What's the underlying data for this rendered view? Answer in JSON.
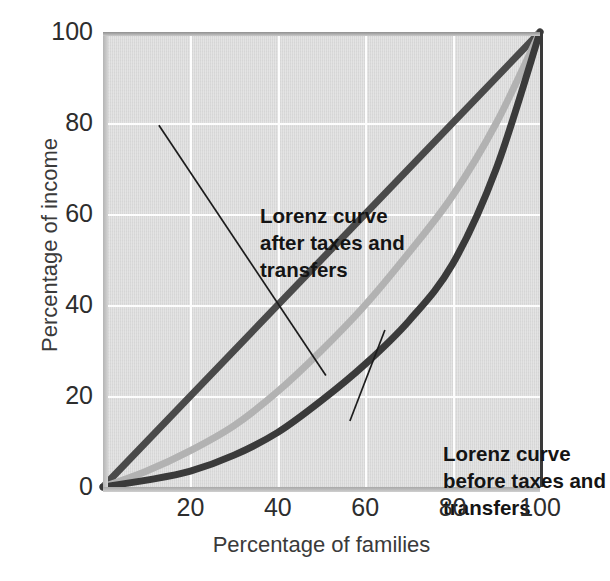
{
  "chart_data": {
    "type": "line",
    "title": "",
    "subtitle": "",
    "xlabel": "Percentage of families",
    "ylabel": "Percentage of income",
    "xlim": [
      0,
      100
    ],
    "ylim": [
      0,
      100
    ],
    "xticks": [
      20,
      40,
      60,
      80,
      100
    ],
    "yticks": [
      0,
      20,
      40,
      60,
      80,
      100
    ],
    "grid": true,
    "gridlines_x": [
      20,
      40,
      60,
      80
    ],
    "gridlines_y": [
      20,
      40,
      60,
      80
    ],
    "legend_position": "none",
    "plot_background_color": "#d9d9d9",
    "gridline_color": "#fdfdfd",
    "x": [
      0,
      10,
      20,
      30,
      40,
      50,
      60,
      70,
      80,
      90,
      100
    ],
    "series": [
      {
        "name": "Line of equality",
        "color": "#4a4a4a",
        "values": [
          0,
          10,
          20,
          30,
          40,
          50,
          60,
          70,
          80,
          90,
          100
        ]
      },
      {
        "name": "Lorenz curve after taxes and transfers",
        "color": "#b2b2b2",
        "values": [
          0,
          3.5,
          8,
          13.5,
          21,
          30,
          40,
          51.5,
          64,
          80,
          100
        ]
      },
      {
        "name": "Lorenz curve before taxes and transfers",
        "color": "#3a3a3a",
        "values": [
          0,
          1.5,
          3.5,
          7,
          12,
          19,
          27,
          36.5,
          49,
          70,
          100
        ]
      }
    ],
    "annotations": [
      {
        "name": "after-taxes",
        "text": "Lorenz curve\nafter taxes and\ntransfers",
        "leader_from": [
          0.128,
          0.205
        ],
        "leader_to": [
          0.51,
          0.755
        ]
      },
      {
        "name": "before-taxes",
        "text": "Lorenz curve\nbefore taxes and\ntransfers",
        "leader_from": [
          0.565,
          0.855
        ],
        "leader_to": [
          0.645,
          0.655
        ]
      }
    ]
  },
  "axes": {
    "x_title": "Percentage of families",
    "y_title": "Percentage of income",
    "x_tick_labels": [
      "20",
      "40",
      "60",
      "80",
      "100"
    ],
    "y_tick_labels": [
      "0",
      "20",
      "40",
      "60",
      "80",
      "100"
    ]
  },
  "annotations": {
    "after_taxes": "Lorenz curve\nafter taxes and\ntransfers",
    "before_taxes": "Lorenz curve\nbefore taxes and\ntransfers"
  },
  "colors": {
    "equality_line": "#4a4a4a",
    "lorenz_after": "#b2b2b2",
    "lorenz_before": "#3a3a3a",
    "plot_bg": "#d9d9d9",
    "grid": "#fdfdfd",
    "text": "#2d2d2d"
  }
}
